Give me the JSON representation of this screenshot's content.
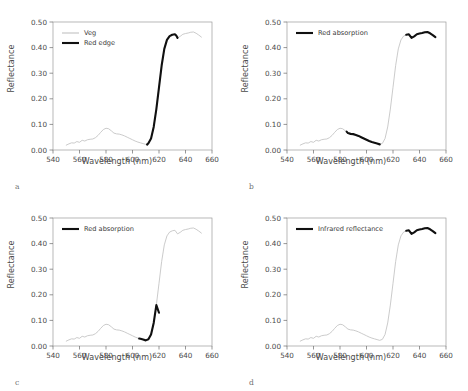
{
  "figure": {
    "panels": [
      {
        "letter": "a",
        "xlabel": "Wavelength (nm)",
        "ylabel": "Reflectance",
        "legend": [
          {
            "label": "Veg",
            "style": "base"
          },
          {
            "label": "Red edge",
            "style": "highlight"
          }
        ],
        "highlight_range": [
          611,
          634
        ]
      },
      {
        "letter": "b",
        "xlabel": "Wavelength (nm)",
        "ylabel": "Reflectance",
        "legend": [
          {
            "label": "Red absorption",
            "style": "highlight"
          }
        ],
        "highlight_range": [
          585,
          610
        ],
        "highlight_range2": [
          630,
          652
        ]
      },
      {
        "letter": "c",
        "xlabel": "Wavelength (nm)",
        "ylabel": "Reflectance",
        "legend": [
          {
            "label": "Red absorption",
            "style": "highlight"
          }
        ],
        "highlight_range": [
          605,
          620
        ]
      },
      {
        "letter": "d",
        "xlabel": "Wavelength (nm)",
        "ylabel": "Reflectance",
        "legend": [
          {
            "label": "Infrared reflectance",
            "style": "highlight"
          }
        ],
        "highlight_range": [
          630,
          652
        ]
      }
    ]
  },
  "chart_data": [
    {
      "type": "line",
      "title": "",
      "panel": "a",
      "xlabel": "Wavelength (nm)",
      "ylabel": "Reflectance",
      "xlim": [
        540,
        660
      ],
      "ylim": [
        0.0,
        0.5
      ],
      "xticks": [
        540,
        560,
        580,
        600,
        620,
        640,
        660
      ],
      "yticks": [
        0.0,
        0.1,
        0.2,
        0.3,
        0.4,
        0.5
      ],
      "ytick_labels": [
        "0.00",
        "0.10",
        "0.20",
        "0.30",
        "0.40",
        "0.50"
      ],
      "grid": false,
      "legend_position": "upper-left",
      "series": [
        {
          "name": "Veg",
          "color": "#c2c2c2",
          "x": [
            550,
            552,
            554,
            556,
            558,
            560,
            562,
            564,
            566,
            568,
            570,
            572,
            574,
            576,
            578,
            580,
            582,
            584,
            586,
            588,
            590,
            592,
            594,
            596,
            598,
            600,
            602,
            604,
            606,
            608,
            610,
            612,
            614,
            616,
            618,
            620,
            622,
            624,
            626,
            628,
            630,
            632,
            634,
            636,
            638,
            640,
            642,
            644,
            646,
            648,
            650,
            652
          ],
          "y": [
            0.019,
            0.024,
            0.028,
            0.027,
            0.033,
            0.03,
            0.038,
            0.035,
            0.04,
            0.042,
            0.043,
            0.048,
            0.057,
            0.069,
            0.08,
            0.085,
            0.083,
            0.075,
            0.066,
            0.063,
            0.062,
            0.059,
            0.055,
            0.05,
            0.045,
            0.04,
            0.035,
            0.031,
            0.028,
            0.025,
            0.022,
            0.026,
            0.045,
            0.09,
            0.16,
            0.245,
            0.33,
            0.395,
            0.43,
            0.445,
            0.45,
            0.452,
            0.438,
            0.444,
            0.452,
            0.455,
            0.457,
            0.46,
            0.461,
            0.456,
            0.449,
            0.441
          ]
        },
        {
          "name": "Red edge",
          "color": "#101010",
          "x": [
            611,
            612,
            614,
            616,
            618,
            620,
            622,
            624,
            626,
            628,
            630,
            632,
            633,
            634
          ],
          "y": [
            0.021,
            0.026,
            0.045,
            0.09,
            0.16,
            0.245,
            0.33,
            0.395,
            0.43,
            0.445,
            0.45,
            0.452,
            0.447,
            0.438
          ]
        }
      ]
    },
    {
      "type": "line",
      "title": "",
      "panel": "b",
      "xlabel": "Wavelength (nm)",
      "ylabel": "Reflectance",
      "xlim": [
        540,
        660
      ],
      "ylim": [
        0.0,
        0.5
      ],
      "xticks": [
        540,
        560,
        580,
        600,
        620,
        640,
        660
      ],
      "yticks": [
        0.0,
        0.1,
        0.2,
        0.3,
        0.4,
        0.5
      ],
      "ytick_labels": [
        "0.00",
        "0.10",
        "0.20",
        "0.30",
        "0.40",
        "0.50"
      ],
      "grid": false,
      "legend_position": "upper-left",
      "series": [
        {
          "name": "Veg",
          "color": "#c2c2c2",
          "x": [
            550,
            552,
            554,
            556,
            558,
            560,
            562,
            564,
            566,
            568,
            570,
            572,
            574,
            576,
            578,
            580,
            582,
            584,
            586,
            588,
            590,
            592,
            594,
            596,
            598,
            600,
            602,
            604,
            606,
            608,
            610,
            612,
            614,
            616,
            618,
            620,
            622,
            624,
            626,
            628,
            630,
            632,
            634,
            636,
            638,
            640,
            642,
            644,
            646,
            648,
            650,
            652
          ],
          "y": [
            0.019,
            0.024,
            0.028,
            0.027,
            0.033,
            0.03,
            0.038,
            0.035,
            0.04,
            0.042,
            0.043,
            0.048,
            0.057,
            0.069,
            0.08,
            0.085,
            0.083,
            0.075,
            0.066,
            0.063,
            0.062,
            0.059,
            0.055,
            0.05,
            0.045,
            0.04,
            0.035,
            0.031,
            0.028,
            0.025,
            0.022,
            0.026,
            0.045,
            0.09,
            0.16,
            0.245,
            0.33,
            0.395,
            0.43,
            0.445,
            0.45,
            0.452,
            0.438,
            0.444,
            0.452,
            0.455,
            0.457,
            0.46,
            0.461,
            0.456,
            0.449,
            0.441
          ]
        },
        {
          "name": "Red absorption",
          "color": "#101010",
          "x": [
            585,
            586,
            588,
            590,
            592,
            594,
            596,
            598,
            600,
            602,
            604,
            606,
            608,
            610
          ],
          "y": [
            0.072,
            0.066,
            0.063,
            0.062,
            0.059,
            0.055,
            0.05,
            0.045,
            0.04,
            0.035,
            0.031,
            0.028,
            0.025,
            0.022
          ]
        },
        {
          "name": "Red absorption plateau",
          "color": "#101010",
          "x": [
            630,
            632,
            634,
            636,
            638,
            640,
            642,
            644,
            646,
            648,
            650,
            652
          ],
          "y": [
            0.45,
            0.452,
            0.438,
            0.444,
            0.452,
            0.455,
            0.457,
            0.46,
            0.461,
            0.456,
            0.449,
            0.441
          ]
        }
      ]
    },
    {
      "type": "line",
      "title": "",
      "panel": "c",
      "xlabel": "Wavelength (nm)",
      "ylabel": "Reflectance",
      "xlim": [
        540,
        660
      ],
      "ylim": [
        0.0,
        0.5
      ],
      "xticks": [
        540,
        560,
        580,
        600,
        620,
        640,
        660
      ],
      "yticks": [
        0.0,
        0.1,
        0.2,
        0.3,
        0.4,
        0.5
      ],
      "ytick_labels": [
        "0.00",
        "0.10",
        "0.20",
        "0.30",
        "0.40",
        "0.50"
      ],
      "grid": false,
      "legend_position": "upper-left",
      "series": [
        {
          "name": "Veg",
          "color": "#c2c2c2",
          "x": [
            550,
            552,
            554,
            556,
            558,
            560,
            562,
            564,
            566,
            568,
            570,
            572,
            574,
            576,
            578,
            580,
            582,
            584,
            586,
            588,
            590,
            592,
            594,
            596,
            598,
            600,
            602,
            604,
            606,
            608,
            610,
            612,
            614,
            616,
            618,
            620,
            622,
            624,
            626,
            628,
            630,
            632,
            634,
            636,
            638,
            640,
            642,
            644,
            646,
            648,
            650,
            652
          ],
          "y": [
            0.019,
            0.024,
            0.028,
            0.027,
            0.033,
            0.03,
            0.038,
            0.035,
            0.04,
            0.042,
            0.043,
            0.048,
            0.057,
            0.069,
            0.08,
            0.085,
            0.083,
            0.075,
            0.066,
            0.063,
            0.062,
            0.059,
            0.055,
            0.05,
            0.045,
            0.04,
            0.035,
            0.031,
            0.028,
            0.025,
            0.022,
            0.026,
            0.045,
            0.09,
            0.16,
            0.245,
            0.33,
            0.395,
            0.43,
            0.445,
            0.45,
            0.452,
            0.438,
            0.444,
            0.452,
            0.455,
            0.457,
            0.46,
            0.461,
            0.456,
            0.449,
            0.441
          ]
        },
        {
          "name": "Red absorption",
          "color": "#101010",
          "x": [
            605,
            606,
            608,
            610,
            612,
            614,
            616,
            618,
            620
          ],
          "y": [
            0.029,
            0.028,
            0.025,
            0.022,
            0.026,
            0.045,
            0.09,
            0.16,
            0.13
          ]
        }
      ]
    },
    {
      "type": "line",
      "title": "",
      "panel": "d",
      "xlabel": "Wavelength (nm)",
      "ylabel": "Reflectance",
      "xlim": [
        540,
        660
      ],
      "ylim": [
        0.0,
        0.5
      ],
      "xticks": [
        540,
        560,
        580,
        600,
        620,
        640,
        660
      ],
      "yticks": [
        0.0,
        0.1,
        0.2,
        0.3,
        0.4,
        0.5
      ],
      "ytick_labels": [
        "0.00",
        "0.10",
        "0.20",
        "0.30",
        "0.40",
        "0.50"
      ],
      "grid": false,
      "legend_position": "upper-left",
      "series": [
        {
          "name": "Veg",
          "color": "#c2c2c2",
          "x": [
            550,
            552,
            554,
            556,
            558,
            560,
            562,
            564,
            566,
            568,
            570,
            572,
            574,
            576,
            578,
            580,
            582,
            584,
            586,
            588,
            590,
            592,
            594,
            596,
            598,
            600,
            602,
            604,
            606,
            608,
            610,
            612,
            614,
            616,
            618,
            620,
            622,
            624,
            626,
            628,
            630,
            632,
            634,
            636,
            638,
            640,
            642,
            644,
            646,
            648,
            650,
            652
          ],
          "y": [
            0.019,
            0.024,
            0.028,
            0.027,
            0.033,
            0.03,
            0.038,
            0.035,
            0.04,
            0.042,
            0.043,
            0.048,
            0.057,
            0.069,
            0.08,
            0.085,
            0.083,
            0.075,
            0.066,
            0.063,
            0.062,
            0.059,
            0.055,
            0.05,
            0.045,
            0.04,
            0.035,
            0.031,
            0.028,
            0.025,
            0.022,
            0.026,
            0.045,
            0.09,
            0.16,
            0.245,
            0.33,
            0.395,
            0.43,
            0.445,
            0.45,
            0.452,
            0.438,
            0.444,
            0.452,
            0.455,
            0.457,
            0.46,
            0.461,
            0.456,
            0.449,
            0.441
          ]
        },
        {
          "name": "Infrared reflectance",
          "color": "#101010",
          "x": [
            630,
            632,
            634,
            636,
            638,
            640,
            642,
            644,
            646,
            648,
            650,
            652
          ],
          "y": [
            0.45,
            0.452,
            0.438,
            0.444,
            0.452,
            0.455,
            0.457,
            0.46,
            0.461,
            0.456,
            0.449,
            0.441
          ]
        }
      ]
    }
  ]
}
